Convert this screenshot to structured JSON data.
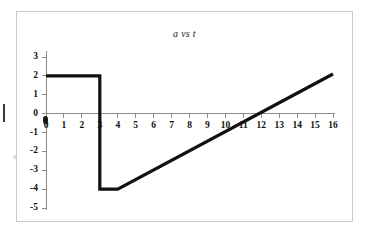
{
  "chart_data": {
    "type": "line",
    "title": "a vs t",
    "xlabel": "",
    "ylabel": "",
    "xlim": [
      0,
      16
    ],
    "ylim": [
      -5,
      3
    ],
    "grid": false,
    "legend": null,
    "x_ticks": [
      "0",
      "1",
      "2",
      "3",
      "4",
      "5",
      "6",
      "7",
      "8",
      "9",
      "10",
      "11",
      "12",
      "13",
      "14",
      "15",
      "16"
    ],
    "y_ticks": [
      "3",
      "2",
      "1",
      "0",
      "-1",
      "-2",
      "-3",
      "-4",
      "-5"
    ],
    "x_tick_values": [
      0,
      1,
      2,
      3,
      4,
      5,
      6,
      7,
      8,
      9,
      10,
      11,
      12,
      13,
      14,
      15,
      16
    ],
    "y_tick_values": [
      3,
      2,
      1,
      0,
      -1,
      -2,
      -3,
      -4,
      -5
    ],
    "series": [
      {
        "name": "a",
        "points": [
          [
            0,
            2
          ],
          [
            3,
            2
          ],
          [
            3,
            -4
          ],
          [
            4,
            -4
          ],
          [
            16,
            2.1
          ]
        ]
      }
    ],
    "line_color": "#111111",
    "axis_color": "#8c8c8c",
    "border_color": "#c9c9c9",
    "background_color": "#ffffff"
  }
}
